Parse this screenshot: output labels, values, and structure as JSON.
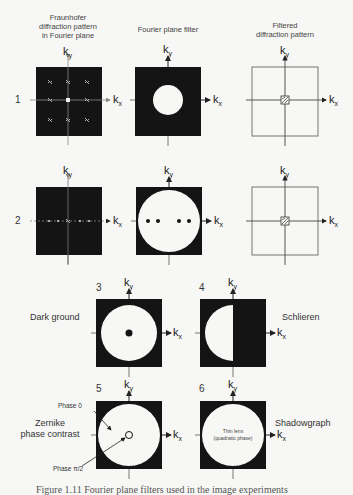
{
  "headers": {
    "col1": [
      "Fraunhofer",
      "diffraction pattern",
      "in Fourier plane"
    ],
    "col2": "Fourier plane filter",
    "col3": [
      "Filtered",
      "diffraction pattern"
    ]
  },
  "axes": {
    "ky": "k",
    "ky_sub": "y",
    "kx": "k",
    "kx_sub": "x"
  },
  "rows": [
    {
      "number": "1",
      "filter": "small centered circular aperture (low-pass)"
    },
    {
      "number": "2",
      "filter": "large circular aperture with four blocked side orders"
    }
  ],
  "filters": [
    {
      "number": "3",
      "name": "Dark ground"
    },
    {
      "number": "4",
      "name": "Schlieren"
    },
    {
      "number": "5",
      "name": "Zernike phase contrast",
      "name_lines": [
        "Zernike",
        "phase contrast"
      ],
      "annotations": [
        "Phase 0",
        "Phase π/2"
      ]
    },
    {
      "number": "6",
      "name": "Shadowgraph",
      "center_text": [
        "Thin lens",
        "(quadratic phase)"
      ]
    }
  ],
  "caption": "Figure 1.11  Fourier plane filters used in the image experiments",
  "colors": {
    "background": "#f7f7f5",
    "filter_black": "#141414",
    "aperture_white": "#f7f7f5",
    "axis": "#555555",
    "box_outline": "#666666"
  }
}
